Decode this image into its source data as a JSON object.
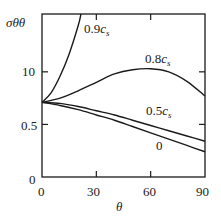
{
  "chart_data": {
    "type": "line",
    "title": "",
    "xlabel": "θ",
    "ylabel": "σθθ",
    "xlim": [
      0,
      90
    ],
    "ylim": [
      0,
      15.5
    ],
    "x_ticks": [
      "0",
      "30",
      "60",
      "90"
    ],
    "y_ticks": [
      {
        "value": 0,
        "label": "0"
      },
      {
        "value": 5,
        "label": "0.5"
      },
      {
        "value": 10,
        "label": "10"
      }
    ],
    "grid": false,
    "legend": "inline labels",
    "x": [
      0,
      10,
      20,
      30,
      40,
      50,
      60,
      70,
      80,
      90
    ],
    "series": [
      {
        "name": "0.9cs",
        "label_main": "0.9",
        "label_sym": "c",
        "label_sub": "s",
        "x": [
          0,
          5,
          10,
          15,
          20,
          21.5
        ],
        "values": [
          7.1,
          8.0,
          9.6,
          11.7,
          14.4,
          15.5
        ]
      },
      {
        "name": "0.8cs",
        "label_main": "0.8",
        "label_sym": "c",
        "label_sub": "s",
        "values": [
          7.1,
          7.5,
          8.2,
          9.0,
          9.8,
          10.2,
          10.3,
          10.0,
          9.1,
          7.7
        ]
      },
      {
        "name": "0.5cs",
        "label_main": "0.5",
        "label_sym": "c",
        "label_sub": "s",
        "values": [
          7.1,
          7.0,
          6.7,
          6.3,
          5.9,
          5.4,
          4.9,
          4.4,
          3.9,
          3.4
        ]
      },
      {
        "name": "0",
        "label_main": "0",
        "label_sym": "",
        "label_sub": "",
        "values": [
          7.1,
          6.8,
          6.4,
          5.9,
          5.4,
          4.8,
          4.2,
          3.6,
          3.0,
          2.4
        ]
      }
    ]
  }
}
